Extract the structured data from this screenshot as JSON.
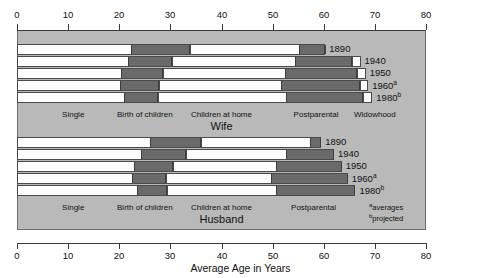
{
  "chart_data": {
    "type": "bar",
    "title": "",
    "xlabel": "Average Age in Years",
    "ylabel": "",
    "xlim": [
      0,
      80
    ],
    "xticks": [
      0,
      10,
      20,
      30,
      40,
      50,
      60,
      70,
      80
    ],
    "grid": false,
    "orientation": "horizontal",
    "stacked": true,
    "legend": "none",
    "stage_names": [
      "Single",
      "Birth of children",
      "Children at home",
      "Postparental",
      "Widowhood"
    ],
    "groups": [
      {
        "name": "Wife",
        "label": "Wife",
        "rows": [
          {
            "year": "1890",
            "sup": "",
            "boundaries": [
              0,
              22.3,
              33.9,
              55.2,
              60.3
            ],
            "end": 60.3
          },
          {
            "year": "1940",
            "sup": "",
            "boundaries": [
              0,
              21.7,
              30.3,
              54.4,
              65.6
            ],
            "end": 67.2
          },
          {
            "year": "1950",
            "sup": "",
            "boundaries": [
              0,
              20.4,
              28.6,
              52.5,
              66.5
            ],
            "end": 68.2
          },
          {
            "year": "1960",
            "sup": "a",
            "boundaries": [
              0,
              20.2,
              27.8,
              51.6,
              67.1
            ],
            "end": 68.7
          },
          {
            "year": "1980",
            "sup": "b",
            "boundaries": [
              0,
              21.0,
              27.5,
              52.6,
              67.7
            ],
            "end": 69.5
          }
        ],
        "stage_label_positions": [
          11.0,
          25.0,
          40.0,
          58.5,
          70.0
        ]
      },
      {
        "name": "Husband",
        "label": "Husband",
        "rows": [
          {
            "year": "1890",
            "sup": "",
            "boundaries": [
              0,
              26.1,
              36.0,
              57.4
            ],
            "end": 59.5
          },
          {
            "year": "1940",
            "sup": "",
            "boundaries": [
              0,
              24.3,
              33.0,
              52.6
            ],
            "end": 62.0
          },
          {
            "year": "1950",
            "sup": "",
            "boundaries": [
              0,
              22.8,
              30.5,
              50.6
            ],
            "end": 63.5
          },
          {
            "year": "1960",
            "sup": "a",
            "boundaries": [
              0,
              22.5,
              29.2,
              49.6
            ],
            "end": 64.7
          },
          {
            "year": "1980",
            "sup": "b",
            "boundaries": [
              0,
              23.5,
              29.3,
              50.6
            ],
            "end": 66.2
          }
        ],
        "stage_label_positions": [
          11.0,
          25.0,
          40.0,
          58.0
        ]
      }
    ]
  },
  "axis": {
    "tick_labels": [
      "0",
      "10",
      "20",
      "30",
      "40",
      "50",
      "60",
      "70",
      "80"
    ],
    "x_axis_title": "Average Age in Years"
  },
  "footnotes": {
    "a_marker": "a",
    "a_text": "averages",
    "b_marker": "b",
    "b_text": "projected"
  },
  "colors": {
    "panel_background": "#b9b9b9",
    "bar_fill_light": "#fdfdfd",
    "bar_fill_dark": "#6a6a6a",
    "outline": "#4a4a4a",
    "text": "#111111"
  }
}
